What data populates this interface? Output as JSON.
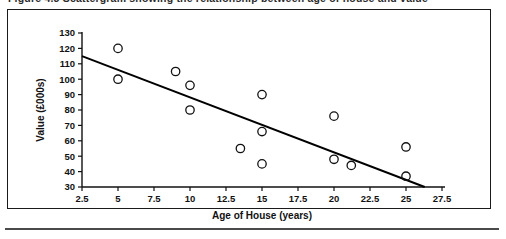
{
  "caption": {
    "text": "Figure 4.3  Scattergram showing the relationship between age of house and value"
  },
  "chart_data": {
    "type": "scatter",
    "title": "",
    "xlabel": "Age of House (years)",
    "ylabel": "Value (£000s)",
    "xlim": [
      2.5,
      27.5
    ],
    "ylim": [
      30,
      130
    ],
    "xticks": [
      "2.5",
      "5",
      "7.5",
      "10",
      "12.5",
      "15",
      "17.5",
      "20",
      "22.5",
      "25",
      "27.5"
    ],
    "yticks": [
      "30",
      "40",
      "50",
      "60",
      "70",
      "80",
      "90",
      "100",
      "110",
      "120",
      "130"
    ],
    "grid": false,
    "legend": false,
    "points": [
      {
        "x": 5.0,
        "y": 120
      },
      {
        "x": 5.0,
        "y": 100
      },
      {
        "x": 9.0,
        "y": 105
      },
      {
        "x": 10.0,
        "y": 96
      },
      {
        "x": 10.0,
        "y": 80
      },
      {
        "x": 13.5,
        "y": 55
      },
      {
        "x": 15.0,
        "y": 90
      },
      {
        "x": 15.0,
        "y": 66
      },
      {
        "x": 15.0,
        "y": 45
      },
      {
        "x": 20.0,
        "y": 76
      },
      {
        "x": 20.0,
        "y": 48
      },
      {
        "x": 21.2,
        "y": 44
      },
      {
        "x": 25.0,
        "y": 56
      },
      {
        "x": 25.0,
        "y": 37
      }
    ],
    "trend_line": {
      "x0": 2.5,
      "y0": 115,
      "x1": 26.3,
      "y1": 30
    }
  }
}
